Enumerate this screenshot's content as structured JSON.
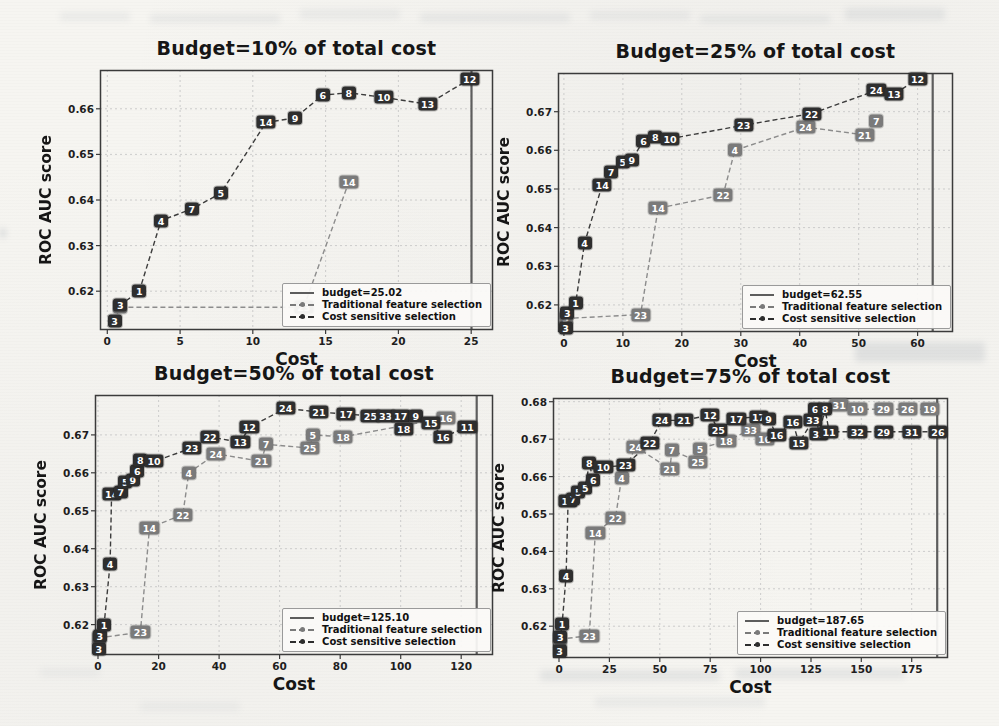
{
  "style": {
    "paper": "#f6f5f1",
    "cost_sensitive_color": "#2e2e2e",
    "traditional_color": "#7a7a7a",
    "cs_line_color": "#3c3c3c",
    "tr_line_color": "#8c8c8c",
    "grid_color": "#c7c7c7",
    "axes_color": "#3b3b3b",
    "budget_line_color": "#5d5d5d"
  },
  "chart_data": [
    {
      "type": "line",
      "title": "Budget=10% of total cost",
      "xlabel": "Cost",
      "ylabel": "ROC AUC score",
      "xlim": [
        -0.5,
        26.5
      ],
      "ylim": [
        0.6115,
        0.6685
      ],
      "xticks": [
        0,
        5,
        10,
        15,
        20,
        25
      ],
      "yticks": [
        0.62,
        0.63,
        0.64,
        0.65,
        0.66
      ],
      "grid": true,
      "budget_x": 25.02,
      "legend_position": "lower right",
      "legend": {
        "budget": "budget=25.02",
        "traditional": "Traditional feature selection",
        "cost_sensitive": "Cost sensitive selection"
      },
      "series": {
        "traditional": {
          "name": "Traditional feature selection",
          "points": [
            [
              0.9,
              0.6165,
              "3"
            ],
            [
              13.5,
              0.6165,
              "23"
            ],
            [
              16.6,
              0.644,
              "14"
            ]
          ]
        },
        "cost_sensitive": {
          "name": "Cost sensitive selection",
          "points": [
            [
              0.5,
              0.6135,
              "3"
            ],
            [
              0.9,
              0.617,
              "3"
            ],
            [
              2.2,
              0.62,
              "1"
            ],
            [
              3.7,
              0.6355,
              "4"
            ],
            [
              5.8,
              0.638,
              "7"
            ],
            [
              7.8,
              0.6415,
              "5"
            ],
            [
              10.9,
              0.657,
              "14"
            ],
            [
              12.9,
              0.658,
              "9"
            ],
            [
              14.8,
              0.663,
              "6"
            ],
            [
              16.6,
              0.6635,
              "8"
            ],
            [
              19.0,
              0.6625,
              "10"
            ],
            [
              22.0,
              0.661,
              "13"
            ],
            [
              24.9,
              0.6665,
              "12"
            ]
          ]
        }
      }
    },
    {
      "type": "line",
      "title": "Budget=25% of total cost",
      "xlabel": "Cost",
      "ylabel": "ROC AUC score",
      "xlim": [
        -1,
        66
      ],
      "ylim": [
        0.613,
        0.68
      ],
      "xticks": [
        0,
        10,
        20,
        30,
        40,
        50,
        60
      ],
      "yticks": [
        0.62,
        0.63,
        0.64,
        0.65,
        0.66,
        0.67
      ],
      "grid": true,
      "budget_x": 62.55,
      "legend_position": "lower right",
      "legend": {
        "budget": "budget=62.55",
        "traditional": "Traditional feature selection",
        "cost_sensitive": "Cost sensitive selection"
      },
      "series": {
        "traditional": {
          "name": "Traditional feature selection",
          "points": [
            [
              0.3,
              0.6165,
              "3"
            ],
            [
              13.0,
              0.6175,
              "23"
            ],
            [
              16.0,
              0.645,
              "14"
            ],
            [
              27.0,
              0.6485,
              "22"
            ],
            [
              29.0,
              0.66,
              "4"
            ],
            [
              41.0,
              0.666,
              "24"
            ],
            [
              51.0,
              0.664,
              "21"
            ],
            [
              53.0,
              0.6675,
              "7"
            ]
          ]
        },
        "cost_sensitive": {
          "name": "Cost sensitive selection",
          "points": [
            [
              0.3,
              0.614,
              "3"
            ],
            [
              0.6,
              0.618,
              "3"
            ],
            [
              2.0,
              0.6205,
              "1"
            ],
            [
              3.5,
              0.636,
              "4"
            ],
            [
              6.5,
              0.651,
              "14"
            ],
            [
              8.0,
              0.6545,
              "7"
            ],
            [
              10.0,
              0.657,
              "5"
            ],
            [
              11.5,
              0.6575,
              "9"
            ],
            [
              13.5,
              0.6625,
              "6"
            ],
            [
              15.5,
              0.6635,
              "8"
            ],
            [
              18.0,
              0.663,
              "10"
            ],
            [
              30.5,
              0.6665,
              "23"
            ],
            [
              42.0,
              0.6695,
              "22"
            ],
            [
              53.0,
              0.6755,
              "24"
            ],
            [
              56.0,
              0.6745,
              "13"
            ],
            [
              60.0,
              0.6785,
              "12"
            ]
          ]
        }
      }
    },
    {
      "type": "line",
      "title": "Budget=50% of total cost",
      "xlabel": "Cost",
      "ylabel": "ROC AUC score",
      "xlim": [
        -1,
        130.5
      ],
      "ylim": [
        0.612,
        0.6805
      ],
      "xticks": [
        0,
        20,
        40,
        60,
        80,
        100,
        120
      ],
      "yticks": [
        0.62,
        0.63,
        0.64,
        0.65,
        0.66,
        0.67
      ],
      "grid": true,
      "budget_x": 125.1,
      "legend_position": "lower right",
      "legend": {
        "budget": "budget=125.10",
        "traditional": "Traditional feature selection",
        "cost_sensitive": "Cost sensitive selection"
      },
      "series": {
        "traditional": {
          "name": "Traditional feature selection",
          "points": [
            [
              0.3,
              0.6165,
              "3"
            ],
            [
              14.0,
              0.618,
              "23"
            ],
            [
              17.0,
              0.6455,
              "14"
            ],
            [
              28.0,
              0.649,
              "22"
            ],
            [
              30.0,
              0.66,
              "4"
            ],
            [
              39.0,
              0.665,
              "24"
            ],
            [
              54.0,
              0.663,
              "21"
            ],
            [
              55.5,
              0.6675,
              "7"
            ],
            [
              70.0,
              0.6665,
              "25"
            ],
            [
              71.0,
              0.67,
              "5"
            ],
            [
              81.0,
              0.6695,
              "18"
            ],
            [
              115.0,
              0.6745,
              "16"
            ]
          ]
        },
        "cost_sensitive": {
          "name": "Cost sensitive selection",
          "points": [
            [
              0.3,
              0.6135,
              "3"
            ],
            [
              0.6,
              0.617,
              "3"
            ],
            [
              2.0,
              0.62,
              "1"
            ],
            [
              4.0,
              0.636,
              "4"
            ],
            [
              4.5,
              0.6545,
              "14"
            ],
            [
              7.5,
              0.655,
              "7"
            ],
            [
              9.0,
              0.6575,
              "5"
            ],
            [
              11.5,
              0.658,
              "9"
            ],
            [
              13.0,
              0.6605,
              "6"
            ],
            [
              14.0,
              0.6635,
              "8"
            ],
            [
              18.5,
              0.663,
              "10"
            ],
            [
              31.0,
              0.6665,
              "23"
            ],
            [
              37.0,
              0.6695,
              "22"
            ],
            [
              47.0,
              0.668,
              "13"
            ],
            [
              50.0,
              0.672,
              "12"
            ],
            [
              62.0,
              0.677,
              "24"
            ],
            [
              73.0,
              0.676,
              "21"
            ],
            [
              82.0,
              0.6755,
              "17"
            ],
            [
              90.0,
              0.675,
              "25"
            ],
            [
              95.0,
              0.675,
              "33"
            ],
            [
              100.0,
              0.675,
              "17"
            ],
            [
              101.0,
              0.6715,
              "18"
            ],
            [
              105.0,
              0.675,
              "9"
            ],
            [
              110.0,
              0.673,
              "15"
            ],
            [
              114.0,
              0.6695,
              "16"
            ],
            [
              122.0,
              0.672,
              "11"
            ]
          ]
        }
      }
    },
    {
      "type": "line",
      "title": "Budget=75% of total cost",
      "xlabel": "Cost",
      "ylabel": "ROC AUC score",
      "xlim": [
        -3,
        193
      ],
      "ylim": [
        0.6115,
        0.681
      ],
      "xticks": [
        0,
        25,
        50,
        75,
        100,
        125,
        150,
        175
      ],
      "yticks": [
        0.62,
        0.63,
        0.64,
        0.65,
        0.66,
        0.67,
        0.68
      ],
      "grid": true,
      "budget_x": 187.65,
      "legend_position": "lower right",
      "legend": {
        "budget": "budget=187.65",
        "traditional": "Traditional feature selection",
        "cost_sensitive": "Cost sensitive selection"
      },
      "series": {
        "traditional": {
          "name": "Traditional feature selection",
          "points": [
            [
              0.3,
              0.6165,
              "3"
            ],
            [
              15.0,
              0.6175,
              "23"
            ],
            [
              18.0,
              0.645,
              "14"
            ],
            [
              28.0,
              0.649,
              "22"
            ],
            [
              31.0,
              0.6595,
              "4"
            ],
            [
              38.0,
              0.668,
              "24"
            ],
            [
              55.0,
              0.662,
              "21"
            ],
            [
              56.0,
              0.667,
              "7"
            ],
            [
              69.0,
              0.664,
              "25"
            ],
            [
              70.0,
              0.6675,
              "5"
            ],
            [
              83.0,
              0.6695,
              "18"
            ],
            [
              95.0,
              0.6725,
              "33"
            ],
            [
              102.0,
              0.67,
              "16"
            ],
            [
              139.0,
              0.679,
              "31"
            ],
            [
              148.0,
              0.678,
              "10"
            ],
            [
              161.0,
              0.678,
              "29"
            ],
            [
              173.0,
              0.678,
              "26"
            ],
            [
              184.0,
              0.678,
              "19"
            ]
          ]
        },
        "cost_sensitive": {
          "name": "Cost sensitive selection",
          "points": [
            [
              0.3,
              0.6135,
              "3"
            ],
            [
              0.6,
              0.617,
              "3"
            ],
            [
              1.5,
              0.6205,
              "1"
            ],
            [
              3.5,
              0.6335,
              "4"
            ],
            [
              4.5,
              0.6535,
              "14"
            ],
            [
              7.0,
              0.654,
              "7"
            ],
            [
              9.5,
              0.656,
              "5"
            ],
            [
              13.0,
              0.657,
              "5"
            ],
            [
              15.0,
              0.6635,
              "8"
            ],
            [
              17.0,
              0.659,
              "6"
            ],
            [
              22.0,
              0.6625,
              "10"
            ],
            [
              33.0,
              0.663,
              "23"
            ],
            [
              45.0,
              0.669,
              "22"
            ],
            [
              51.0,
              0.675,
              "24"
            ],
            [
              62.0,
              0.675,
              "21"
            ],
            [
              75.0,
              0.6765,
              "12"
            ],
            [
              79.0,
              0.6725,
              "25"
            ],
            [
              88.0,
              0.6755,
              "17"
            ],
            [
              99.0,
              0.676,
              "17"
            ],
            [
              104.0,
              0.6755,
              "9"
            ],
            [
              108.0,
              0.671,
              "16"
            ],
            [
              116.0,
              0.6745,
              "16"
            ],
            [
              119.0,
              0.669,
              "15"
            ],
            [
              126.0,
              0.675,
              "33"
            ],
            [
              127.0,
              0.678,
              "6"
            ],
            [
              129.0,
              0.6715,
              "32"
            ],
            [
              132.0,
              0.678,
              "8"
            ],
            [
              134.0,
              0.672,
              "11"
            ],
            [
              148.0,
              0.672,
              "32"
            ],
            [
              161.0,
              0.672,
              "29"
            ],
            [
              175.0,
              0.672,
              "31"
            ],
            [
              188.0,
              0.672,
              "26"
            ]
          ]
        }
      }
    }
  ]
}
